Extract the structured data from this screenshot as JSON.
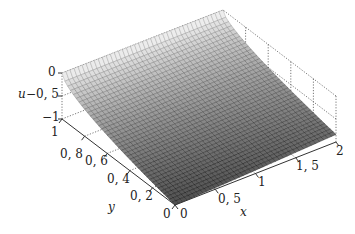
{
  "chart_data": {
    "type": "surface3d",
    "title": "",
    "xlabel": "x",
    "ylabel": "y",
    "zlabel": "u",
    "xlim": [
      0,
      2
    ],
    "ylim": [
      0,
      1
    ],
    "zlim": [
      -1,
      0
    ],
    "x_ticks": [
      "0",
      "0.5",
      "1",
      "1.5",
      "2"
    ],
    "y_ticks": [
      "0",
      "0.2",
      "0.4",
      "0.6",
      "0.8",
      "1"
    ],
    "z_ticks": [
      "0",
      "-0.5",
      "-1"
    ],
    "x_tick_labels_display": [
      "0",
      "0, 5",
      "1",
      "1, 5",
      "2"
    ],
    "y_tick_labels_display": [
      "0",
      "0, 2",
      "0, 4",
      "0, 6",
      "0, 8",
      "1"
    ],
    "z_tick_labels_display": [
      "0",
      "−0, 5",
      "−1"
    ],
    "grid": true,
    "grid_style": "dotted",
    "colormap": "gray",
    "mesh_resolution": 40,
    "surface_samples": {
      "description": "approximate u(x,y) read from figure",
      "points": [
        {
          "x": 0,
          "y": 1,
          "u": 0
        },
        {
          "x": 0,
          "y": 0.5,
          "u": -0.75
        },
        {
          "x": 0,
          "y": 0,
          "u": -1
        },
        {
          "x": 2,
          "y": 1,
          "u": 0
        },
        {
          "x": 2,
          "y": 0,
          "u": -0.9
        },
        {
          "x": 1,
          "y": 0,
          "u": -1
        },
        {
          "x": 1,
          "y": 1,
          "u": -0.25
        }
      ]
    }
  }
}
